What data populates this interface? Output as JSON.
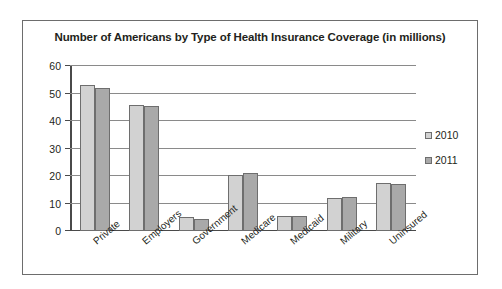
{
  "chart_data": {
    "type": "bar",
    "title": "Number of Americans by Type of Health Insurance Coverage (in millions)",
    "xlabel": "",
    "ylabel": "",
    "ylim": [
      0,
      60
    ],
    "yticks": [
      0,
      10,
      20,
      30,
      40,
      50,
      60
    ],
    "grid": true,
    "legend_position": "right",
    "categories": [
      "Private",
      "Employers",
      "Government",
      "Medicare",
      "Medicaid",
      "Military",
      "Uninsured"
    ],
    "series": [
      {
        "name": "2010",
        "color": "#d2d2d2",
        "values": [
          53,
          46,
          5,
          20.5,
          5.5,
          12,
          17.5
        ]
      },
      {
        "name": "2011",
        "color": "#a9a9a9",
        "values": [
          52,
          45.5,
          4.5,
          21,
          5.5,
          12.5,
          17
        ]
      }
    ]
  }
}
